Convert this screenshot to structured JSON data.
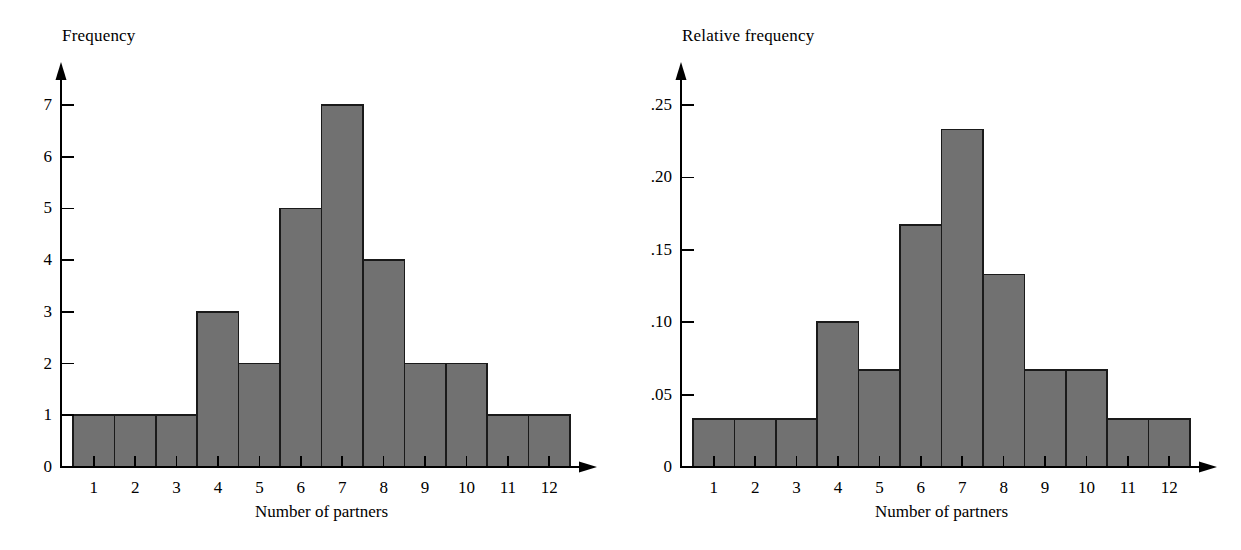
{
  "figure": {
    "background": "#ffffff",
    "bar_fill": "#717171",
    "bar_stroke": "#1a1a1a",
    "axis_color": "#000000"
  },
  "charts": [
    {
      "id": "frequency-histogram",
      "title": "Frequency",
      "xlabel": "Number of partners",
      "ylabel": "Frequency",
      "ytick_labels": [
        "0",
        "1",
        "2",
        "3",
        "4",
        "5",
        "6",
        "7"
      ],
      "ytick_values": [
        0,
        1,
        2,
        3,
        4,
        5,
        6,
        7
      ],
      "xtick_labels": [
        "1",
        "2",
        "3",
        "4",
        "5",
        "6",
        "7",
        "8",
        "9",
        "10",
        "11",
        "12"
      ],
      "values": [
        1,
        1,
        1,
        3,
        2,
        5,
        7,
        4,
        2,
        2,
        1,
        1
      ],
      "ymax": 7.6
    },
    {
      "id": "relative-frequency-histogram",
      "title": "Relative frequency",
      "xlabel": "Number of partners",
      "ylabel": "Relative frequency",
      "ytick_labels": [
        "0",
        ".05",
        ".10",
        ".15",
        ".20",
        ".25"
      ],
      "ytick_values": [
        0,
        0.05,
        0.1,
        0.15,
        0.2,
        0.25
      ],
      "xtick_labels": [
        "1",
        "2",
        "3",
        "4",
        "5",
        "6",
        "7",
        "8",
        "9",
        "10",
        "11",
        "12"
      ],
      "values": [
        0.033,
        0.033,
        0.033,
        0.1,
        0.067,
        0.167,
        0.233,
        0.133,
        0.067,
        0.067,
        0.033,
        0.033
      ],
      "ymax": 0.2625
    }
  ],
  "chart_data": [
    {
      "type": "bar",
      "title": "Frequency",
      "xlabel": "Number of partners",
      "ylabel": "Frequency",
      "categories": [
        "1",
        "2",
        "3",
        "4",
        "5",
        "6",
        "7",
        "8",
        "9",
        "10",
        "11",
        "12"
      ],
      "values": [
        1,
        1,
        1,
        3,
        2,
        5,
        7,
        4,
        2,
        2,
        1,
        1
      ],
      "ylim": [
        0,
        7
      ],
      "yticks": [
        0,
        1,
        2,
        3,
        4,
        5,
        6,
        7
      ],
      "ytick_labels": [
        "0",
        "1",
        "2",
        "3",
        "4",
        "5",
        "6",
        "7"
      ],
      "grid": false,
      "legend": "none",
      "notes": "Histogram of number of partners; total n = 30; bars touch (contiguous class intervals)."
    },
    {
      "type": "bar",
      "title": "Relative frequency",
      "xlabel": "Number of partners",
      "ylabel": "Relative frequency",
      "categories": [
        "1",
        "2",
        "3",
        "4",
        "5",
        "6",
        "7",
        "8",
        "9",
        "10",
        "11",
        "12"
      ],
      "values": [
        0.033,
        0.033,
        0.033,
        0.1,
        0.067,
        0.167,
        0.233,
        0.133,
        0.067,
        0.067,
        0.033,
        0.033
      ],
      "ylim": [
        0,
        0.25
      ],
      "yticks": [
        0,
        0.05,
        0.1,
        0.15,
        0.2,
        0.25
      ],
      "ytick_labels": [
        "0",
        ".05",
        ".10",
        ".15",
        ".20",
        ".25"
      ],
      "grid": false,
      "legend": "none",
      "notes": "Same data as left panel expressed as relative frequencies (frequency / 30)."
    }
  ]
}
